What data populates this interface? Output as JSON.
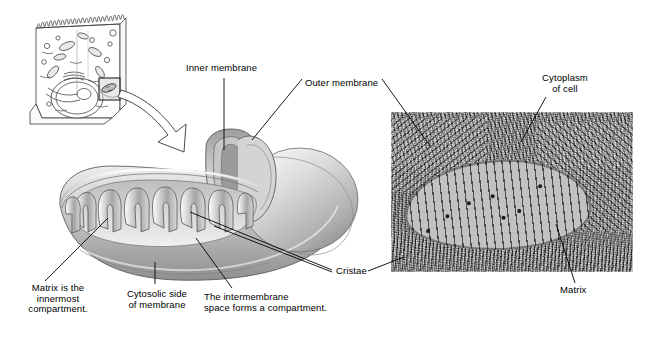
{
  "figure": {
    "background_color": "#ffffff",
    "line_color": "#000000"
  },
  "labels": {
    "inner_membrane": "Inner membrane",
    "outer_membrane": "Outer membrane",
    "cytoplasm_of_cell": "Cytoplasm\nof cell",
    "cristae": "Cristae",
    "matrix_right": "Matrix",
    "matrix_note": "Matrix is the\ninnermost\ncompartment.",
    "cytosolic_side": "Cytosolic side\nof membrane",
    "intermembrane_note": "The intermembrane\nspace forms a compartment."
  },
  "panels": {
    "cell_diagram": {
      "name": "epithelial cell line drawing",
      "features": [
        "microvilli",
        "nucleus",
        "endoplasmic reticulum",
        "golgi",
        "mitochondria",
        "callout box"
      ]
    },
    "mitochondrion_drawing": {
      "name": "cut-away 3D mitochondrion",
      "features": [
        "outer membrane",
        "inner membrane",
        "cristae",
        "matrix",
        "intermembrane space"
      ]
    },
    "micrograph": {
      "name": "transmission electron micrograph of a mitochondrion",
      "background_color": "#8d8d8d",
      "mitochondrion_fill": "#b9b9b9"
    }
  }
}
